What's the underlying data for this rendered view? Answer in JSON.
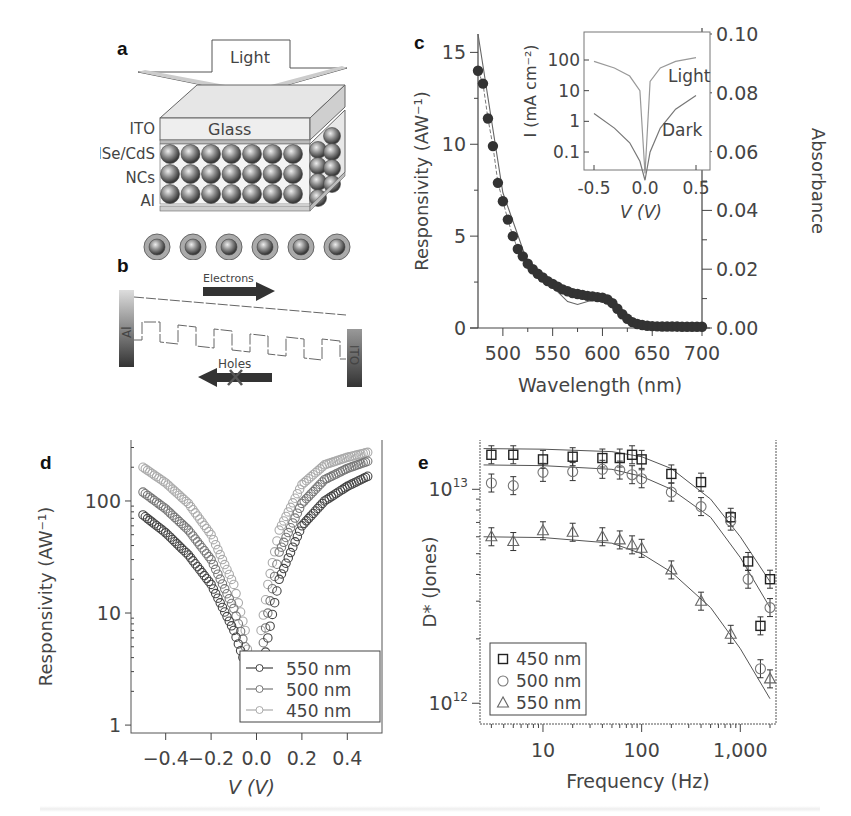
{
  "figure": {
    "panels": {
      "a": {
        "label": "a",
        "light_label": "Light",
        "layers": [
          "ITO",
          "CdSe/CdS",
          "NCs",
          "Al"
        ],
        "glass_label": "Glass"
      },
      "b": {
        "label": "b",
        "electrons_label": "Electrons",
        "holes_label": "Holes",
        "left_electrode": "Al",
        "right_electrode": "ITO"
      },
      "c": {
        "label": "c"
      },
      "d": {
        "label": "d"
      },
      "e": {
        "label": "e"
      }
    }
  },
  "chart_data": [
    {
      "id": "c",
      "type": "scatter",
      "title": "",
      "xlabel": "Wavelength (nm)",
      "ylabel": "Responsivity (AW⁻¹)",
      "y2label": "Absorbance",
      "xlim": [
        475,
        700
      ],
      "ylim": [
        0,
        16
      ],
      "y2lim": [
        0,
        0.1
      ],
      "xticks": [
        500,
        550,
        600,
        650,
        700
      ],
      "yticks": [
        0,
        5,
        10,
        15
      ],
      "y2ticks": [
        "0.00",
        "0.02",
        "0.04",
        "0.06",
        "0.08",
        "0.10"
      ],
      "grid": false,
      "series": [
        {
          "name": "Responsivity",
          "marker": "filled-circle",
          "x": [
            475,
            480,
            485,
            490,
            495,
            500,
            505,
            510,
            515,
            520,
            525,
            530,
            535,
            540,
            545,
            550,
            555,
            560,
            565,
            570,
            575,
            580,
            585,
            590,
            595,
            600,
            605,
            610,
            615,
            620,
            625,
            630,
            635,
            640,
            645,
            650,
            655,
            660,
            665,
            670,
            675,
            680,
            685,
            690,
            695,
            700
          ],
          "y": [
            14.0,
            13.3,
            11.4,
            9.9,
            7.9,
            6.9,
            5.9,
            5.0,
            4.3,
            3.9,
            3.5,
            3.2,
            2.95,
            2.75,
            2.55,
            2.4,
            2.25,
            2.1,
            2.0,
            1.9,
            1.85,
            1.8,
            1.75,
            1.72,
            1.68,
            1.65,
            1.55,
            1.35,
            1.05,
            0.75,
            0.5,
            0.32,
            0.22,
            0.16,
            0.12,
            0.1,
            0.09,
            0.08,
            0.08,
            0.08,
            0.08,
            0.07,
            0.07,
            0.07,
            0.07,
            0.07
          ]
        },
        {
          "name": "Absorbance",
          "marker": "line",
          "x": [
            475,
            500,
            525,
            550,
            565,
            575,
            585,
            600,
            610,
            625,
            640,
            700
          ],
          "y": [
            0.1,
            0.046,
            0.022,
            0.014,
            0.009,
            0.008,
            0.009,
            0.01,
            0.008,
            0.003,
            0.001,
            0.0
          ]
        }
      ],
      "inset": {
        "type": "line",
        "xlabel": "V (V)",
        "ylabel": "I (mA cm⁻²)",
        "xticks": [
          "-0.5",
          "0.0",
          "0.5"
        ],
        "yticks": [
          "0.1",
          "1",
          "10",
          "100"
        ],
        "ylog": true,
        "series": [
          {
            "name": "Light",
            "x": [
              -0.5,
              -0.3,
              -0.15,
              -0.05,
              0.0,
              0.05,
              0.15,
              0.3,
              0.5
            ],
            "y": [
              90,
              55,
              30,
              10,
              0.02,
              20,
              55,
              90,
              120
            ]
          },
          {
            "name": "Dark",
            "x": [
              -0.5,
              -0.3,
              -0.15,
              -0.05,
              0.0,
              0.05,
              0.15,
              0.3,
              0.5
            ],
            "y": [
              1.8,
              0.6,
              0.2,
              0.05,
              0.01,
              0.1,
              0.6,
              2.5,
              7
            ]
          }
        ],
        "annotations": [
          "Light",
          "Dark"
        ]
      }
    },
    {
      "id": "d",
      "type": "scatter",
      "title": "",
      "xlabel": "V (V)",
      "ylabel": "Responsivity (AW⁻¹)",
      "xlim": [
        -0.52,
        0.52
      ],
      "ylim": [
        0.85,
        350
      ],
      "ylog": true,
      "xticks": [
        "-0.4",
        "-0.2",
        "0.0",
        "0.2",
        "0.4"
      ],
      "yticks": [
        "1",
        "10",
        "100"
      ],
      "grid": false,
      "legend": {
        "position": "lower-right",
        "entries": [
          "550 nm",
          "500 nm",
          "450 nm"
        ]
      },
      "series": [
        {
          "name": "550 nm",
          "color": "#444444",
          "x": [
            -0.5,
            -0.4,
            -0.3,
            -0.2,
            -0.1,
            -0.05,
            -0.02,
            0.02,
            0.05,
            0.1,
            0.2,
            0.3,
            0.4,
            0.5
          ],
          "y": [
            75,
            52,
            33,
            18,
            7,
            3.5,
            1.2,
            2.5,
            6,
            20,
            60,
            100,
            135,
            170
          ]
        },
        {
          "name": "500 nm",
          "color": "#777777",
          "x": [
            -0.5,
            -0.4,
            -0.3,
            -0.2,
            -0.1,
            -0.05,
            -0.02,
            0.02,
            0.05,
            0.1,
            0.2,
            0.3,
            0.4,
            0.5
          ],
          "y": [
            120,
            85,
            55,
            30,
            11,
            5,
            1.5,
            4,
            10,
            35,
            95,
            155,
            195,
            230
          ]
        },
        {
          "name": "450 nm",
          "color": "#aaaaaa",
          "x": [
            -0.5,
            -0.4,
            -0.3,
            -0.2,
            -0.1,
            -0.05,
            -0.02,
            0.02,
            0.05,
            0.1,
            0.2,
            0.3,
            0.4,
            0.5
          ],
          "y": [
            200,
            145,
            95,
            50,
            18,
            7,
            2.2,
            7,
            18,
            55,
            140,
            210,
            245,
            275
          ]
        }
      ]
    },
    {
      "id": "e",
      "type": "scatter",
      "title": "",
      "xlabel": "Frequency (Hz)",
      "ylabel": "D* (Jones)",
      "xlog": true,
      "ylog": true,
      "xlim": [
        2.3,
        2300
      ],
      "ylim": [
        800000000000.0,
        17000000000000.0
      ],
      "xticks": [
        "10",
        "100",
        "1,000"
      ],
      "yticks": [
        "10^12",
        "10^13"
      ],
      "grid": false,
      "legend": {
        "position": "lower-left",
        "entries": [
          "450 nm",
          "500 nm",
          "550 nm"
        ]
      },
      "series": [
        {
          "name": "450 nm",
          "marker": "square",
          "x": [
            3,
            5,
            10,
            20,
            40,
            60,
            80,
            100,
            200,
            400,
            800,
            1200,
            1600,
            2000
          ],
          "y": [
            14500000000000.0,
            14500000000000.0,
            13800000000000.0,
            14200000000000.0,
            14000000000000.0,
            14000000000000.0,
            14500000000000.0,
            13800000000000.0,
            11800000000000.0,
            10800000000000.0,
            7400000000000.0,
            4600000000000.0,
            2300000000000.0,
            3800000000000.0
          ]
        },
        {
          "name": "500 nm",
          "marker": "circle",
          "x": [
            3,
            5,
            10,
            20,
            40,
            60,
            80,
            100,
            200,
            400,
            800,
            1200,
            1600,
            2000
          ],
          "y": [
            10700000000000.0,
            10400000000000.0,
            12000000000000.0,
            12100000000000.0,
            12400000000000.0,
            12300000000000.0,
            11700000000000.0,
            11200000000000.0,
            9700000000000.0,
            8300000000000.0,
            7100000000000.0,
            3800000000000.0,
            1450000000000.0,
            2800000000000.0
          ]
        },
        {
          "name": "550 nm",
          "marker": "triangle",
          "x": [
            3,
            5,
            10,
            20,
            40,
            60,
            80,
            100,
            200,
            400,
            800,
            2000
          ],
          "y": [
            6000000000000.0,
            5700000000000.0,
            6400000000000.0,
            6300000000000.0,
            6000000000000.0,
            5800000000000.0,
            5500000000000.0,
            5300000000000.0,
            4200000000000.0,
            3000000000000.0,
            2100000000000.0,
            1300000000000.0
          ]
        }
      ],
      "fits": [
        {
          "name": "450 nm fit",
          "x": [
            2.5,
            10,
            50,
            100,
            200,
            500,
            1000,
            2000
          ],
          "y": [
            15500000000000.0,
            15400000000000.0,
            15000000000000.0,
            14200000000000.0,
            12500000000000.0,
            9000000000000.0,
            6000000000000.0,
            3700000000000.0
          ]
        },
        {
          "name": "500 nm fit",
          "x": [
            2.5,
            10,
            50,
            100,
            200,
            500,
            1000,
            2000
          ],
          "y": [
            13000000000000.0,
            12900000000000.0,
            12400000000000.0,
            11500000000000.0,
            10000000000000.0,
            7400000000000.0,
            4800000000000.0,
            2800000000000.0
          ]
        },
        {
          "name": "550 nm fit",
          "x": [
            2.5,
            10,
            50,
            100,
            200,
            500,
            1000,
            2000
          ],
          "y": [
            6000000000000.0,
            5950000000000.0,
            5600000000000.0,
            5000000000000.0,
            4100000000000.0,
            2800000000000.0,
            1800000000000.0,
            1050000000000.0
          ]
        }
      ]
    }
  ]
}
